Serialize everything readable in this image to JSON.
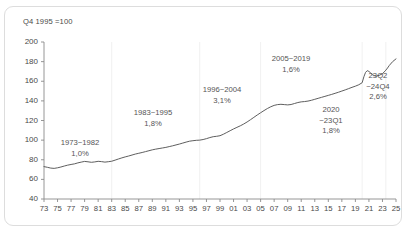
{
  "header": {
    "note": "Q4 1995 =100"
  },
  "chart_data": {
    "type": "line",
    "title": "",
    "subtitle": "",
    "xlabel": "",
    "ylabel": "",
    "index_note": "Q4 1995 =100",
    "ylim": [
      40,
      200
    ],
    "yticks": [
      40,
      60,
      80,
      100,
      120,
      140,
      160,
      180,
      200
    ],
    "xlim": [
      1973,
      2025
    ],
    "xticks": [
      73,
      75,
      77,
      79,
      81,
      83,
      85,
      87,
      89,
      91,
      93,
      95,
      97,
      99,
      "01",
      "03",
      "05",
      "07",
      "09",
      11,
      13,
      15,
      17,
      19,
      21,
      23,
      25
    ],
    "grid": "vertical-segment-dividers",
    "grid_years": [
      1983,
      1996,
      2005,
      2020,
      2023.5
    ],
    "legend": "none",
    "line_color": "#555555",
    "series": [
      {
        "name": "Index",
        "x": [
          1973.0,
          1973.5,
          1974.0,
          1974.5,
          1975.0,
          1975.5,
          1976.0,
          1976.5,
          1977.0,
          1977.5,
          1978.0,
          1978.5,
          1979.0,
          1979.5,
          1980.0,
          1980.5,
          1981.0,
          1981.5,
          1982.0,
          1982.5,
          1983.0,
          1983.5,
          1984.0,
          1984.5,
          1985.0,
          1985.5,
          1986.0,
          1986.5,
          1987.0,
          1987.5,
          1988.0,
          1988.5,
          1989.0,
          1989.5,
          1990.0,
          1990.5,
          1991.0,
          1991.5,
          1992.0,
          1992.5,
          1993.0,
          1993.5,
          1994.0,
          1994.5,
          1995.0,
          1995.5,
          1996.0,
          1996.5,
          1997.0,
          1997.5,
          1998.0,
          1998.5,
          1999.0,
          1999.5,
          2000.0,
          2000.5,
          2001.0,
          2001.5,
          2002.0,
          2002.5,
          2003.0,
          2003.5,
          2004.0,
          2004.5,
          2005.0,
          2005.5,
          2006.0,
          2006.5,
          2007.0,
          2007.5,
          2008.0,
          2008.5,
          2009.0,
          2009.5,
          2010.0,
          2010.5,
          2011.0,
          2011.5,
          2012.0,
          2012.5,
          2013.0,
          2013.5,
          2014.0,
          2014.5,
          2015.0,
          2015.5,
          2016.0,
          2016.5,
          2017.0,
          2017.5,
          2018.0,
          2018.5,
          2019.0,
          2019.5,
          2020.0,
          2020.25,
          2020.5,
          2020.75,
          2021.0,
          2021.25,
          2021.5,
          2021.75,
          2022.0,
          2022.5,
          2023.0,
          2023.25,
          2023.5,
          2023.75,
          2024.0,
          2024.5,
          2025.0
        ],
        "values": [
          73.0,
          72.3,
          71.5,
          71.2,
          71.8,
          72.6,
          73.6,
          74.5,
          75.2,
          75.8,
          76.8,
          77.6,
          78.3,
          77.9,
          77.4,
          77.8,
          78.4,
          78.1,
          77.6,
          78.0,
          78.5,
          79.6,
          80.8,
          81.9,
          82.9,
          83.8,
          84.8,
          85.8,
          86.6,
          87.4,
          88.3,
          89.2,
          90.1,
          90.8,
          91.4,
          92.0,
          92.6,
          93.4,
          94.2,
          95.1,
          96.0,
          97.0,
          98.0,
          98.9,
          99.4,
          99.8,
          100.0,
          100.6,
          101.5,
          102.6,
          103.5,
          103.9,
          104.5,
          106.0,
          107.8,
          109.6,
          111.4,
          113.0,
          114.6,
          116.4,
          118.5,
          120.8,
          123.2,
          125.6,
          127.9,
          130.1,
          132.2,
          134.0,
          135.4,
          136.2,
          136.5,
          136.2,
          135.9,
          136.3,
          137.3,
          138.3,
          139.0,
          139.3,
          139.8,
          140.6,
          141.6,
          142.6,
          143.6,
          144.6,
          145.6,
          146.6,
          147.7,
          148.8,
          150.0,
          151.2,
          152.5,
          153.8,
          155.0,
          156.4,
          158.5,
          164.5,
          169.0,
          170.8,
          170.0,
          168.5,
          166.8,
          165.8,
          165.2,
          166.0,
          167.6,
          169.5,
          171.3,
          173.5,
          176.0,
          180.0,
          182.8
        ]
      }
    ],
    "annotations": [
      {
        "id": "period-1973-1982",
        "period": "1973~1982",
        "rate": "1,0%",
        "label_period": "1973~1982",
        "label_rate": "1,0%"
      },
      {
        "id": "period-1983-1995",
        "period": "1983~1995",
        "rate": "1,8%",
        "label_period": "1983~1995",
        "label_rate": "1,8%"
      },
      {
        "id": "period-1996-2004",
        "period": "1996~2004",
        "rate": "3,1%",
        "label_period": "1996~2004",
        "label_rate": "3,1%"
      },
      {
        "id": "period-2005-2019",
        "period": "2005~2019",
        "rate": "1,6%",
        "label_period": "2005~2019",
        "label_rate": "1,6%"
      },
      {
        "id": "period-2020-23q1",
        "period": "2020",
        "period2": "~23Q1",
        "rate": "1,8%"
      },
      {
        "id": "period-23q2-24q4",
        "period": "23Q2",
        "period2": "~24Q4",
        "rate": "2,6%"
      }
    ]
  }
}
